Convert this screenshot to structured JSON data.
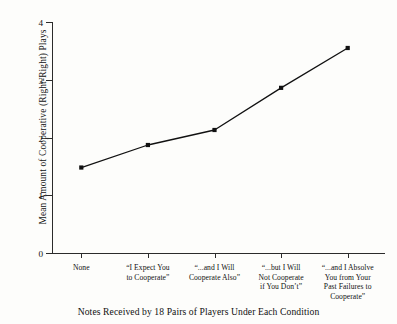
{
  "chart_data": {
    "type": "line",
    "title": "",
    "caption": "Notes Received by 18 Pairs of Players Under Each Condition",
    "xlabel": "",
    "ylabel": "Mean Amount of Cooperative (Right-Right) Plays",
    "ylim": [
      0,
      4
    ],
    "yticks": [
      0,
      1,
      2,
      3,
      4
    ],
    "ytick_labels": [
      "0",
      "1",
      "2",
      "3",
      "4"
    ],
    "grid": false,
    "legend": "none",
    "marker": "square",
    "line_color": "#111111",
    "categories": [
      "None",
      "“I Expect You to Cooperate”",
      "“...and I Will Cooperate Also”",
      "“...but I Will Not Cooperate if You Don’t”",
      "“...and I Absolve You from Your Past Failures to Cooperate”"
    ],
    "category_lines": [
      [
        "None"
      ],
      [
        "“I Expect You",
        "to Cooperate”"
      ],
      [
        "“...and I Will",
        "Cooperate Also”"
      ],
      [
        "“...but I Will",
        "Not Cooperate",
        "if You Don’t”"
      ],
      [
        "“...and I Absolve",
        "You from Your",
        "Past Failures to",
        "Cooperate”"
      ]
    ],
    "values": [
      1.48,
      1.87,
      2.13,
      2.86,
      3.55
    ]
  }
}
